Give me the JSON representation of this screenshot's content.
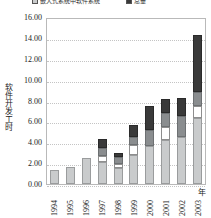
{
  "chart_data": {
    "type": "bar",
    "subtype": "stacked-bar",
    "title": "",
    "xlabel": "年",
    "ylabel": "软件开发工时",
    "ylim": [
      0,
      16
    ],
    "ytick_step": 2,
    "grid": true,
    "legend_position": "top",
    "categories": [
      "1994",
      "1995",
      "1996",
      "1997",
      "1998",
      "1999",
      "2000",
      "2001",
      "2002",
      "2003"
    ],
    "ytick_labels": [
      "16.00",
      "14.00",
      "12.00",
      "10.00",
      "8.00",
      "6.00",
      "4.00",
      "2.00",
      "0.00"
    ],
    "series": [
      {
        "name": "嵌入式系统中软件系统",
        "color": "#c9cbcc",
        "values": [
          1.3,
          1.65,
          2.45,
          2.15,
          1.5,
          2.75,
          3.6,
          4.2,
          4.55,
          6.3
        ]
      },
      {
        "name": "系列二",
        "color": "#ffffff",
        "values": [
          0.0,
          0.0,
          0.0,
          0.55,
          0.4,
          1.0,
          0.0,
          1.3,
          0.0,
          1.15
        ]
      },
      {
        "name": "系列三",
        "color": "#8a8d8f",
        "values": [
          0.0,
          0.0,
          0.0,
          0.75,
          0.7,
          0.75,
          1.6,
          1.35,
          1.95,
          1.4
        ]
      },
      {
        "name": "总量",
        "color": "#3a3a3a",
        "values": [
          0.0,
          0.0,
          0.0,
          0.85,
          0.4,
          1.15,
          2.25,
          1.3,
          1.7,
          5.4
        ]
      }
    ],
    "totals": [
      1.3,
      1.65,
      2.45,
      4.3,
      3.0,
      5.65,
      7.45,
      8.15,
      8.2,
      14.25
    ]
  },
  "legend": {
    "entries": [
      {
        "label": "嵌入式系统中软件系统",
        "swatch": "s0"
      },
      {
        "label": "总量",
        "swatch": "s3"
      }
    ]
  }
}
